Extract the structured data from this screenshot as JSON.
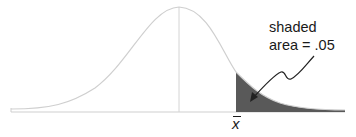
{
  "diagram": {
    "type": "normal-distribution-curve",
    "annotation": {
      "line1": "shaded",
      "line2": "area = .05"
    },
    "x_label": "x",
    "x_label_overbar": true,
    "shaded_region": "right-tail",
    "shaded_area": ".05",
    "colors": {
      "curve": "#cfcfcf",
      "baseline": "#cfcfcf",
      "shade": "#595959",
      "arrow": "#222222",
      "text": "#1a1a1a"
    }
  }
}
